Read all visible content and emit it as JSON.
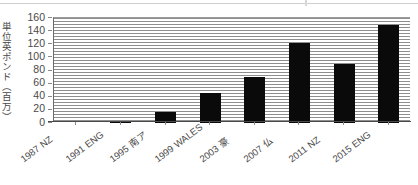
{
  "chart_data": {
    "type": "bar",
    "title": "",
    "subtitle": "",
    "xlabel": "",
    "ylabel": "単位英ポンド（百万）",
    "ylim": [
      0,
      160
    ],
    "ytick_values": [
      160,
      140,
      120,
      100,
      80,
      60,
      40,
      20,
      0
    ],
    "ytick_labels": [
      "160",
      "140",
      "120",
      "100",
      "80",
      "60",
      "40",
      "20",
      "0"
    ],
    "grid": true,
    "grid_orientation": "horizontal",
    "legend": "none",
    "bar_color": "#0a0a0a",
    "categories": [
      "1987　NZ",
      "1991　ENG",
      "1995　南ア",
      "1999　WALES",
      "2003　豪",
      "2007　仏",
      "2011　NZ",
      "2015　ENG"
    ],
    "category_parts": [
      {
        "year": "1987",
        "nation": "NZ"
      },
      {
        "year": "1991",
        "nation": "ENG"
      },
      {
        "year": "1995",
        "nation": "南ア"
      },
      {
        "year": "1999",
        "nation": "WALES"
      },
      {
        "year": "2003",
        "nation": "豪"
      },
      {
        "year": "2007",
        "nation": "仏"
      },
      {
        "year": "2011",
        "nation": "NZ"
      },
      {
        "year": "2015",
        "nation": "ENG"
      }
    ],
    "values": [
      0,
      3,
      17,
      45,
      70,
      122,
      90,
      150
    ]
  }
}
